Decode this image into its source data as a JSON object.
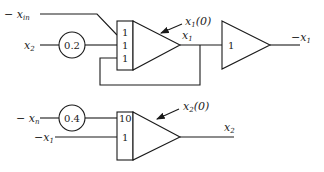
{
  "diagram": {
    "type": "analog-computer-block-diagram",
    "integrator_1": {
      "input_gains": [
        "1",
        "1",
        "1"
      ],
      "initial_condition_label": "x",
      "initial_condition_sub": "1",
      "initial_condition_suffix": "(0)",
      "output_label": "x",
      "output_sub": "1"
    },
    "potentiometer_1": {
      "value": "0.2"
    },
    "input_neg_xin": {
      "prefix": "− ",
      "label": "x",
      "sub": "in"
    },
    "input_x2": {
      "label": "x",
      "sub": "2"
    },
    "inverter": {
      "gain": "1",
      "output_prefix": "−",
      "output_label": "x",
      "output_sub": "1"
    },
    "integrator_2": {
      "input_gains": [
        "10",
        "1"
      ],
      "initial_condition_label": "x",
      "initial_condition_sub": "2",
      "initial_condition_suffix": "(0)",
      "output_label": "x",
      "output_sub": "2"
    },
    "potentiometer_2": {
      "value": "0.4"
    },
    "input_neg_xn": {
      "prefix": "− ",
      "label": "x",
      "sub": "n"
    },
    "input_neg_x1": {
      "prefix": "−",
      "label": "x",
      "sub": "1"
    }
  }
}
